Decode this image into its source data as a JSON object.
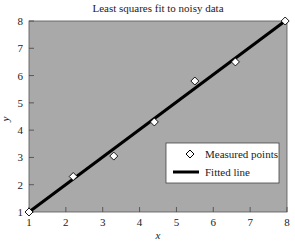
{
  "chart_data": {
    "type": "scatter",
    "title": "Least squares fit to noisy data",
    "xlabel": "x",
    "ylabel": "y",
    "xlim": [
      1,
      8
    ],
    "ylim": [
      1,
      8
    ],
    "xticks": [
      1,
      2,
      3,
      4,
      5,
      6,
      7,
      8
    ],
    "yticks": [
      1,
      2,
      3,
      4,
      5,
      6,
      7,
      8
    ],
    "grid": false,
    "legend_position": "lower right",
    "series": [
      {
        "name": "Measured points",
        "kind": "scatter",
        "marker": "diamond",
        "x": [
          1.0,
          2.2,
          3.3,
          4.4,
          5.5,
          6.6,
          7.95
        ],
        "y": [
          1.0,
          2.3,
          3.05,
          4.3,
          5.8,
          6.5,
          8.0
        ]
      },
      {
        "name": "Fitted line",
        "kind": "line",
        "x": [
          1.0,
          7.95
        ],
        "y": [
          1.0,
          8.0
        ]
      }
    ],
    "colors": {
      "plot_background": "#a9a9a9",
      "line": "#000000",
      "marker_fill": "#ffffff",
      "marker_edge": "#000000",
      "legend_background": "#ffffff"
    }
  }
}
